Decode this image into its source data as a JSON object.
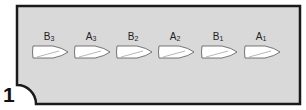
{
  "diagram": {
    "panel_number": "1",
    "colors": {
      "frame_fill": "#d9d9d9",
      "frame_stroke": "#1a1a1a",
      "boat_fill": "#ffffff",
      "boat_stroke": "#555555"
    },
    "boats": [
      {
        "letter": "B",
        "index": "3",
        "cx": 50
      },
      {
        "letter": "A",
        "index": "3",
        "cx": 92
      },
      {
        "letter": "B",
        "index": "2",
        "cx": 134
      },
      {
        "letter": "A",
        "index": "2",
        "cx": 176
      },
      {
        "letter": "B",
        "index": "1",
        "cx": 219
      },
      {
        "letter": "A",
        "index": "1",
        "cx": 262
      }
    ]
  }
}
